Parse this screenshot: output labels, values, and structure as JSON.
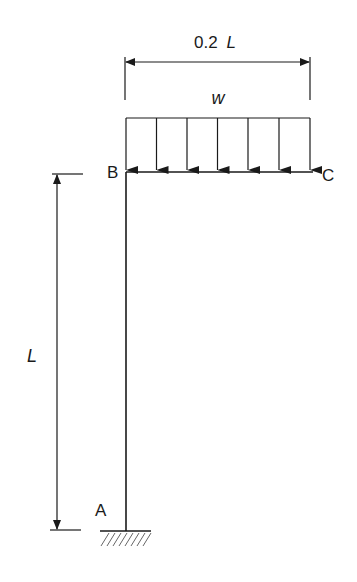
{
  "diagram": {
    "type": "structural frame",
    "labels": {
      "span_dimension": "0.2",
      "span_symbol": "L",
      "load": "w",
      "node_b": "B",
      "node_c": "C",
      "node_a": "A",
      "height_dimension": "L"
    },
    "members": [
      {
        "name": "column",
        "from": "A",
        "to": "B",
        "length": "L"
      },
      {
        "name": "beam",
        "from": "B",
        "to": "C",
        "length": "0.2 L"
      }
    ],
    "load": {
      "type": "uniformly distributed",
      "on": "BC",
      "arrow_count": 7
    },
    "support": {
      "node": "A",
      "type": "fixed"
    },
    "colors": {
      "line": "#1a1a1a",
      "background": "#ffffff"
    }
  }
}
